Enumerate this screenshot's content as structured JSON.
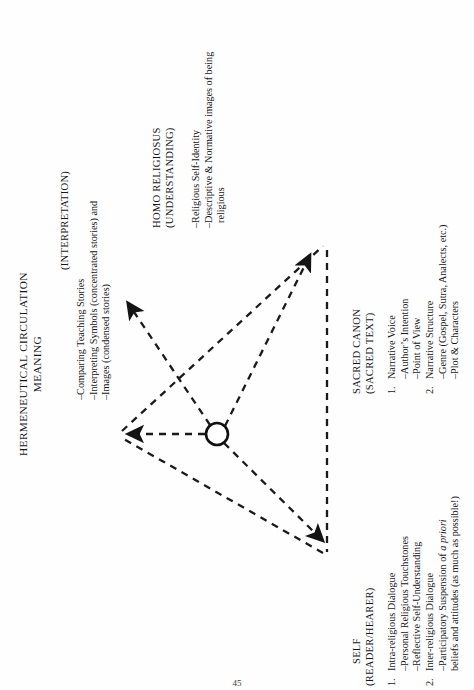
{
  "document": {
    "page_number": "45"
  },
  "figure": {
    "title_line1": "HERMENEUTICAL CIRCULATION",
    "title_line2": "MEANING",
    "interpretation_label": "(INTERPRETATION)",
    "interpretation_items": [
      "–Comparing Teaching Stories",
      "–Interpreting Symbols (concentrated stories) and",
      "–Images (condensed stories)"
    ]
  },
  "node_understanding": {
    "title_line1": "HOMO RELIGIOSUS",
    "title_line2": "(UNDERSTANDING)",
    "items": [
      "–Religious Self-Identity",
      "–Descriptive & Normative images of being",
      "religious"
    ]
  },
  "node_text": {
    "title_line1": "SACRED CANON",
    "title_line2": "(SACRED TEXT)",
    "entries": [
      {
        "num": "1.",
        "text": "Narrative Voice"
      },
      {
        "num": "",
        "text": "–Author’s Intention"
      },
      {
        "num": "",
        "text": "–Point of View"
      },
      {
        "num": "2.",
        "text": "Narrative Structure"
      },
      {
        "num": "",
        "text": "–Genre (Gospel, Sutra, Analects, etc.)"
      },
      {
        "num": "",
        "text": "–Plot & Characters"
      }
    ]
  },
  "node_self": {
    "title_line1": "SELF",
    "title_line2": "(READER/HEARER)",
    "entries": [
      {
        "num": "1.",
        "text": "Intra-religious Dialogue"
      },
      {
        "num": "",
        "text": "–Personal Religious Touchstones"
      },
      {
        "num": "",
        "text": "–Reflective Self-Understanding"
      },
      {
        "num": "2.",
        "text": "Inter-religious Dialogue"
      },
      {
        "num": "",
        "text": "–Participatory Suspension of ",
        "ital": "a priori"
      },
      {
        "num": "",
        "text": "beliefs and attitudes (as much as possible!)"
      }
    ]
  },
  "diagram": {
    "stroke_color": "#1a1a1a",
    "hub_label": "circulation-hub",
    "vertices": {
      "meaning": [
        118,
        434
      ],
      "text": [
        327,
        243
      ],
      "self": [
        327,
        556
      ]
    },
    "hub": {
      "cx": 217,
      "cy": 434,
      "r": 11
    }
  }
}
